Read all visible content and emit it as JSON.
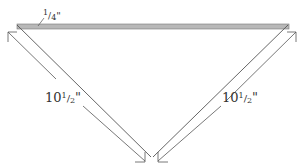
{
  "diagram": {
    "type": "triangle dimension drawing",
    "labels": {
      "thickness": {
        "num": "1",
        "slash": "/",
        "den": "4",
        "unit": "\""
      },
      "left_side": {
        "whole": "10",
        "num": "1",
        "slash": "/",
        "den": "2",
        "unit": "\""
      },
      "right_side": {
        "whole": "10",
        "num": "1",
        "slash": "/",
        "den": "2",
        "unit": "\""
      }
    },
    "colors": {
      "bar_fill": "#b8b8b8",
      "line": "#555555"
    }
  }
}
